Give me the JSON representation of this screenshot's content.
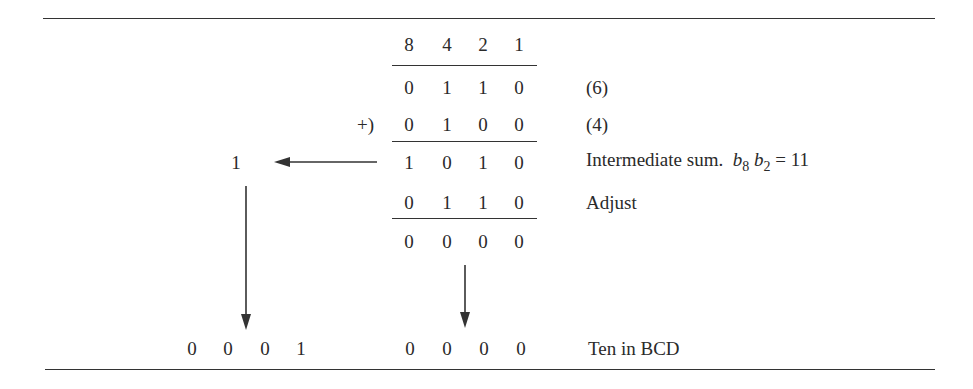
{
  "weights": [
    "8",
    "4",
    "2",
    "1"
  ],
  "rows": [
    {
      "id": "augend",
      "bits": [
        "0",
        "1",
        "1",
        "0"
      ],
      "prefix": "",
      "label": "(6)"
    },
    {
      "id": "addend",
      "bits": [
        "0",
        "1",
        "0",
        "0"
      ],
      "prefix": "+)",
      "label": "(4)"
    },
    {
      "id": "intermediate",
      "bits": [
        "1",
        "0",
        "1",
        "0"
      ],
      "prefix": "",
      "label": "Intermediate sum."
    },
    {
      "id": "adjust",
      "bits": [
        "0",
        "1",
        "1",
        "0"
      ],
      "prefix": "",
      "label": "Adjust"
    },
    {
      "id": "result-low",
      "bits": [
        "0",
        "0",
        "0",
        "0"
      ],
      "prefix": "",
      "label": ""
    }
  ],
  "intermediate_condition": {
    "var1": "b",
    "sub1": "8",
    "var2": "b",
    "sub2": "2",
    "rhs": "= 11"
  },
  "carry": "1",
  "final": {
    "high_nibble": [
      "0",
      "0",
      "0",
      "1"
    ],
    "low_nibble": [
      "0",
      "0",
      "0",
      "0"
    ],
    "label": "Ten in BCD"
  },
  "colors": {
    "ink": "#2a2a2a",
    "rule": "#333333",
    "background": "#ffffff"
  }
}
